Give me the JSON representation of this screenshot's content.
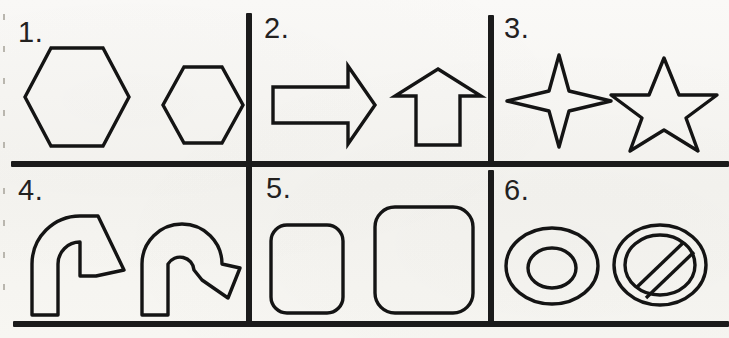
{
  "page": {
    "type": "worksheet-shape-grid",
    "width": 729,
    "height": 338,
    "background_color": "#f7f6f3",
    "ink_color": "#141414",
    "rows": 2,
    "columns": 3
  },
  "rules": {
    "top_rule": false,
    "middle_rule": true,
    "bottom_rule": true,
    "vertical_rules": 2
  },
  "cells": [
    {
      "number": "1.",
      "name": "cell-hexagons",
      "shapes": [
        {
          "name": "hexagon-large",
          "label": "hexagon",
          "size": "large"
        },
        {
          "name": "hexagon-small",
          "label": "hexagon",
          "size": "small"
        }
      ]
    },
    {
      "number": "2.",
      "name": "cell-block-arrows",
      "shapes": [
        {
          "name": "arrow-right",
          "label": "block arrow right",
          "size": "large"
        },
        {
          "name": "arrow-up",
          "label": "block arrow up",
          "size": "large"
        }
      ]
    },
    {
      "number": "3.",
      "name": "cell-stars",
      "shapes": [
        {
          "name": "star-4-point",
          "label": "four pointed star",
          "size": "large"
        },
        {
          "name": "star-5-point",
          "label": "five pointed star",
          "size": "large"
        }
      ]
    },
    {
      "number": "4.",
      "name": "cell-curved-arrows",
      "shapes": [
        {
          "name": "arrow-bent-right",
          "label": "bent arrow turning right",
          "size": "large"
        },
        {
          "name": "arrow-u-turn",
          "label": "u-turn arrow",
          "size": "large"
        }
      ]
    },
    {
      "number": "5.",
      "name": "cell-rounded-rectangles",
      "shapes": [
        {
          "name": "rounded-rectangle-small",
          "label": "rounded rectangle",
          "size": "small"
        },
        {
          "name": "rounded-rectangle-large",
          "label": "rounded rectangle",
          "size": "large"
        }
      ]
    },
    {
      "number": "6.",
      "name": "cell-rings",
      "shapes": [
        {
          "name": "donut",
          "label": "donut ring",
          "size": "large"
        },
        {
          "name": "prohibition-sign",
          "label": "no entry sign",
          "size": "large"
        }
      ]
    }
  ]
}
